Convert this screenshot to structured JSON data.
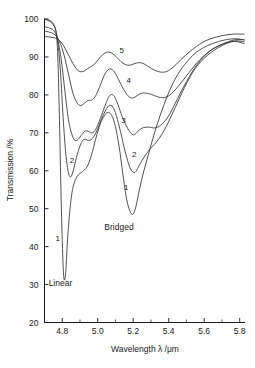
{
  "chart_data": {
    "type": "line",
    "title": "",
    "xlabel": "Wavelength λ /μm",
    "ylabel": "Transmission /%",
    "xlim": [
      4.7,
      5.83
    ],
    "ylim": [
      20,
      100
    ],
    "grid": false,
    "legend": "inline-curve-labels",
    "xticks": [
      4.8,
      5.0,
      5.2,
      5.4,
      5.6,
      5.8
    ],
    "xtick_labels": [
      "4.8",
      "5.0",
      "5.2",
      "5.4",
      "5.6",
      "5.8"
    ],
    "xticks_minor": [
      4.9,
      5.1,
      5.3,
      5.5,
      5.7
    ],
    "yticks": [
      20,
      30,
      40,
      50,
      60,
      70,
      80,
      90,
      100
    ],
    "ytick_labels": [
      "20",
      "30",
      "40",
      "50",
      "60",
      "70",
      "80",
      "90",
      "100"
    ],
    "annotations": [
      {
        "text": "Linear",
        "x": 4.79,
        "y": 29.5
      },
      {
        "text": "Bridged",
        "x": 5.12,
        "y": 44.5
      }
    ],
    "series": [
      {
        "name": "1",
        "label": "1",
        "label_positions": [
          {
            "text": "1",
            "x": 4.775,
            "y": 41.5
          },
          {
            "text": "1",
            "x": 5.16,
            "y": 55.0
          }
        ],
        "points": [
          [
            4.7,
            100.0
          ],
          [
            4.73,
            99.6
          ],
          [
            4.75,
            98.8
          ],
          [
            4.765,
            96.5
          ],
          [
            4.775,
            90.0
          ],
          [
            4.785,
            72.0
          ],
          [
            4.795,
            50.0
          ],
          [
            4.805,
            35.0
          ],
          [
            4.812,
            31.2
          ],
          [
            4.82,
            33.5
          ],
          [
            4.83,
            42.0
          ],
          [
            4.845,
            50.5
          ],
          [
            4.86,
            55.5
          ],
          [
            4.88,
            58.2
          ],
          [
            4.9,
            59.3
          ],
          [
            4.92,
            60.0
          ],
          [
            4.945,
            61.5
          ],
          [
            4.97,
            65.0
          ],
          [
            4.995,
            69.5
          ],
          [
            5.02,
            73.0
          ],
          [
            5.045,
            75.0
          ],
          [
            5.065,
            75.3
          ],
          [
            5.085,
            74.0
          ],
          [
            5.105,
            70.5
          ],
          [
            5.125,
            65.0
          ],
          [
            5.145,
            58.0
          ],
          [
            5.165,
            52.0
          ],
          [
            5.185,
            49.0
          ],
          [
            5.2,
            48.6
          ],
          [
            5.215,
            50.5
          ],
          [
            5.235,
            55.0
          ],
          [
            5.26,
            60.0
          ],
          [
            5.29,
            65.0
          ],
          [
            5.32,
            70.0
          ],
          [
            5.355,
            75.0
          ],
          [
            5.395,
            80.0
          ],
          [
            5.44,
            84.5
          ],
          [
            5.49,
            88.0
          ],
          [
            5.55,
            91.0
          ],
          [
            5.62,
            93.0
          ],
          [
            5.7,
            94.3
          ],
          [
            5.77,
            94.8
          ],
          [
            5.825,
            94.5
          ]
        ]
      },
      {
        "name": "2",
        "label": "2",
        "label_positions": [
          {
            "text": "2",
            "x": 4.855,
            "y": 62.0
          },
          {
            "text": "2",
            "x": 5.205,
            "y": 63.5
          }
        ],
        "points": [
          [
            4.7,
            100.0
          ],
          [
            4.735,
            99.2
          ],
          [
            4.76,
            97.5
          ],
          [
            4.775,
            94.0
          ],
          [
            4.79,
            86.0
          ],
          [
            4.805,
            74.0
          ],
          [
            4.82,
            64.5
          ],
          [
            4.835,
            59.5
          ],
          [
            4.848,
            58.4
          ],
          [
            4.862,
            60.0
          ],
          [
            4.88,
            63.5
          ],
          [
            4.9,
            66.5
          ],
          [
            4.915,
            68.0
          ],
          [
            4.93,
            68.3
          ],
          [
            4.95,
            68.0
          ],
          [
            4.97,
            68.5
          ],
          [
            4.995,
            70.5
          ],
          [
            5.02,
            73.5
          ],
          [
            5.045,
            76.0
          ],
          [
            5.065,
            77.2
          ],
          [
            5.085,
            76.8
          ],
          [
            5.105,
            74.5
          ],
          [
            5.13,
            70.0
          ],
          [
            5.155,
            65.0
          ],
          [
            5.18,
            61.0
          ],
          [
            5.2,
            59.6
          ],
          [
            5.215,
            59.8
          ],
          [
            5.235,
            61.5
          ],
          [
            5.26,
            63.5
          ],
          [
            5.29,
            65.5
          ],
          [
            5.32,
            67.0
          ],
          [
            5.35,
            68.8
          ],
          [
            5.39,
            72.0
          ],
          [
            5.44,
            77.0
          ],
          [
            5.49,
            82.0
          ],
          [
            5.55,
            87.0
          ],
          [
            5.62,
            90.5
          ],
          [
            5.7,
            93.0
          ],
          [
            5.77,
            94.2
          ],
          [
            5.825,
            94.0
          ]
        ]
      },
      {
        "name": "3",
        "label": "3",
        "label_positions": [
          {
            "text": "3",
            "x": 5.145,
            "y": 72.5
          }
        ],
        "points": [
          [
            4.7,
            98.0
          ],
          [
            4.73,
            97.6
          ],
          [
            4.755,
            96.8
          ],
          [
            4.775,
            94.5
          ],
          [
            4.795,
            89.0
          ],
          [
            4.815,
            81.0
          ],
          [
            4.835,
            73.5
          ],
          [
            4.855,
            69.5
          ],
          [
            4.872,
            68.0
          ],
          [
            4.89,
            68.3
          ],
          [
            4.91,
            69.5
          ],
          [
            4.93,
            70.5
          ],
          [
            4.95,
            70.3
          ],
          [
            4.97,
            70.0
          ],
          [
            4.99,
            71.0
          ],
          [
            5.015,
            73.8
          ],
          [
            5.04,
            77.0
          ],
          [
            5.06,
            79.3
          ],
          [
            5.078,
            80.1
          ],
          [
            5.095,
            79.5
          ],
          [
            5.115,
            77.3
          ],
          [
            5.14,
            74.0
          ],
          [
            5.165,
            71.5
          ],
          [
            5.185,
            70.0
          ],
          [
            5.2,
            69.5
          ],
          [
            5.215,
            69.8
          ],
          [
            5.235,
            70.8
          ],
          [
            5.26,
            71.4
          ],
          [
            5.29,
            71.5
          ],
          [
            5.32,
            71.3
          ],
          [
            5.355,
            72.0
          ],
          [
            5.4,
            74.5
          ],
          [
            5.45,
            79.0
          ],
          [
            5.5,
            83.5
          ],
          [
            5.56,
            88.0
          ],
          [
            5.63,
            91.5
          ],
          [
            5.7,
            93.3
          ],
          [
            5.77,
            94.1
          ],
          [
            5.825,
            93.5
          ]
        ]
      },
      {
        "name": "4",
        "label": "4",
        "label_positions": [
          {
            "text": "4",
            "x": 5.175,
            "y": 83.0
          }
        ],
        "points": [
          [
            4.7,
            96.8
          ],
          [
            4.73,
            96.5
          ],
          [
            4.76,
            95.8
          ],
          [
            4.785,
            94.0
          ],
          [
            4.81,
            90.5
          ],
          [
            4.835,
            85.5
          ],
          [
            4.86,
            80.5
          ],
          [
            4.885,
            77.8
          ],
          [
            4.905,
            77.2
          ],
          [
            4.925,
            77.8
          ],
          [
            4.945,
            78.5
          ],
          [
            4.965,
            78.6
          ],
          [
            4.985,
            79.5
          ],
          [
            5.01,
            82.0
          ],
          [
            5.035,
            85.0
          ],
          [
            5.058,
            86.6
          ],
          [
            5.075,
            86.8
          ],
          [
            5.095,
            86.0
          ],
          [
            5.118,
            84.0
          ],
          [
            5.145,
            81.5
          ],
          [
            5.17,
            79.8
          ],
          [
            5.19,
            79.2
          ],
          [
            5.21,
            79.4
          ],
          [
            5.235,
            80.2
          ],
          [
            5.26,
            80.5
          ],
          [
            5.29,
            80.3
          ],
          [
            5.32,
            79.8
          ],
          [
            5.355,
            79.3
          ],
          [
            5.395,
            79.6
          ],
          [
            5.44,
            81.5
          ],
          [
            5.5,
            85.0
          ],
          [
            5.56,
            88.5
          ],
          [
            5.63,
            91.5
          ],
          [
            5.7,
            93.3
          ],
          [
            5.77,
            94.5
          ],
          [
            5.825,
            94.5
          ]
        ]
      },
      {
        "name": "5",
        "label": "5",
        "label_positions": [
          {
            "text": "5",
            "x": 5.135,
            "y": 91.0
          }
        ],
        "points": [
          [
            4.7,
            95.4
          ],
          [
            4.735,
            95.2
          ],
          [
            4.77,
            94.8
          ],
          [
            4.8,
            93.5
          ],
          [
            4.83,
            91.0
          ],
          [
            4.86,
            88.3
          ],
          [
            4.885,
            86.6
          ],
          [
            4.905,
            86.1
          ],
          [
            4.925,
            86.3
          ],
          [
            4.945,
            87.0
          ],
          [
            4.965,
            87.5
          ],
          [
            4.99,
            88.5
          ],
          [
            5.015,
            90.0
          ],
          [
            5.04,
            91.0
          ],
          [
            5.06,
            91.3
          ],
          [
            5.08,
            91.0
          ],
          [
            5.105,
            90.0
          ],
          [
            5.13,
            88.8
          ],
          [
            5.155,
            88.0
          ],
          [
            5.18,
            87.8
          ],
          [
            5.205,
            88.2
          ],
          [
            5.23,
            88.5
          ],
          [
            5.255,
            88.3
          ],
          [
            5.285,
            87.5
          ],
          [
            5.32,
            86.5
          ],
          [
            5.355,
            86.0
          ],
          [
            5.39,
            86.2
          ],
          [
            5.43,
            87.5
          ],
          [
            5.48,
            89.8
          ],
          [
            5.54,
            92.2
          ],
          [
            5.61,
            94.3
          ],
          [
            5.69,
            95.5
          ],
          [
            5.76,
            96.0
          ],
          [
            5.825,
            96.0
          ]
        ]
      }
    ]
  }
}
